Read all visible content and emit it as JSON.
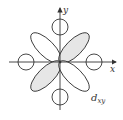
{
  "diagram": {
    "orbital_label": "d",
    "orbital_subscript": "xy",
    "axes": {
      "x_label": "x",
      "y_label": "y"
    },
    "lobes": [
      {
        "position": "top-left",
        "shaded": false
      },
      {
        "position": "top-right",
        "shaded": true
      },
      {
        "position": "bottom-left",
        "shaded": true
      },
      {
        "position": "bottom-right",
        "shaded": false
      }
    ],
    "circles": [
      "top",
      "left",
      "right",
      "bottom"
    ],
    "colors": {
      "stroke": "#333333",
      "shade": "#e6e6e6",
      "background": "#ffffff"
    }
  }
}
